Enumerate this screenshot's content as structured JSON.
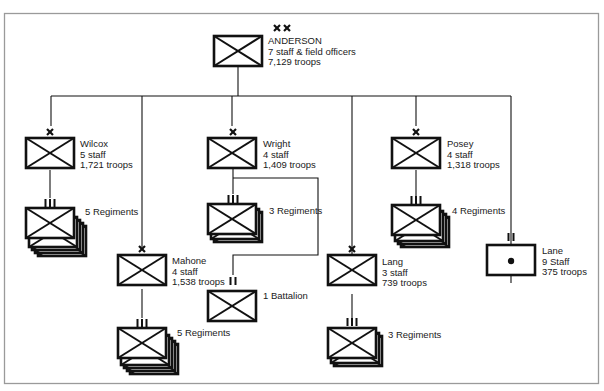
{
  "diagram": {
    "type": "military-organization-chart",
    "division": {
      "symbol": "XX",
      "name": "ANDERSON",
      "staff": "7 staff & field officers",
      "troops": "7,129 troops"
    },
    "brigades": [
      {
        "symbol": "X",
        "name": "Wilcox",
        "staff": "5 staff",
        "troops": "1,721 troops",
        "subunits": [
          {
            "symbol": "III",
            "label": "5 Regiments",
            "count": 5
          }
        ]
      },
      {
        "symbol": "X",
        "name": "Mahone",
        "staff": "4 staff",
        "troops": "1,538 troops",
        "subunits": [
          {
            "symbol": "III",
            "label": "5 Regiments",
            "count": 5
          }
        ]
      },
      {
        "symbol": "X",
        "name": "Wright",
        "staff": "4 staff",
        "troops": "1,409 troops",
        "subunits": [
          {
            "symbol": "III",
            "label": "3 Regiments",
            "count": 3
          },
          {
            "symbol": "II",
            "label": "1 Battalion",
            "count": 1
          }
        ]
      },
      {
        "symbol": "X",
        "name": "Lang",
        "staff": "3 staff",
        "troops": "739 troops",
        "subunits": [
          {
            "symbol": "III",
            "label": "3 Regiments",
            "count": 3
          }
        ]
      },
      {
        "symbol": "X",
        "name": "Posey",
        "staff": "4 staff",
        "troops": "1,318 troops",
        "subunits": [
          {
            "symbol": "III",
            "label": "4 Regiments",
            "count": 4
          }
        ]
      },
      {
        "symbol": "II",
        "name": "Lane",
        "staff": "9 Staff",
        "troops": "375 troops",
        "unit_type": "artillery",
        "subunits": []
      }
    ]
  },
  "colors": {
    "line": "#111111",
    "frame": "#9a9a9a",
    "background": "#ffffff"
  }
}
